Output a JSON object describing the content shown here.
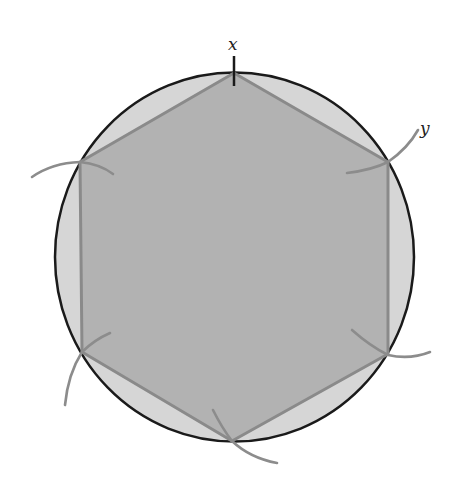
{
  "diagram": {
    "labels": {
      "x": "x",
      "y": "y"
    },
    "colors": {
      "circle_stroke": "#1a1a1a",
      "circle_fill": "#d6d6d6",
      "hexagon_fill": "#b2b2b2",
      "hexagon_stroke": "#8a8a8a",
      "arc_stroke": "#8c8c8c",
      "tick_stroke": "#1a1a1a",
      "background": "#ffffff"
    },
    "circle": {
      "cx": 234,
      "cy": 257,
      "r": 182
    },
    "hexagon_vertices": [
      [
        234,
        73
      ],
      [
        388,
        162
      ],
      [
        388,
        354
      ],
      [
        232,
        441
      ],
      [
        82,
        352
      ],
      [
        80,
        162
      ]
    ]
  }
}
